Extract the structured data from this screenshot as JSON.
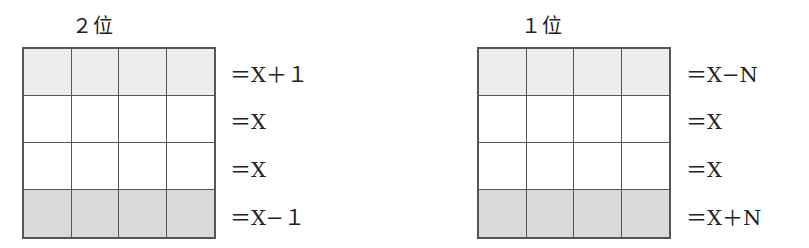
{
  "diagrams": [
    {
      "title": "２位",
      "rows": [
        {
          "label": "＝X＋１",
          "shade": "#ececec"
        },
        {
          "label": "＝X",
          "shade": "#ffffff"
        },
        {
          "label": "＝X",
          "shade": "#ffffff"
        },
        {
          "label": "＝X−１",
          "shade": "#d9d9d9"
        }
      ],
      "columns": 4
    },
    {
      "title": "１位",
      "rows": [
        {
          "label": "＝X−N",
          "shade": "#ececec"
        },
        {
          "label": "＝X",
          "shade": "#ffffff"
        },
        {
          "label": "＝X",
          "shade": "#ffffff"
        },
        {
          "label": "＝X＋N",
          "shade": "#d9d9d9"
        }
      ],
      "columns": 4
    }
  ]
}
